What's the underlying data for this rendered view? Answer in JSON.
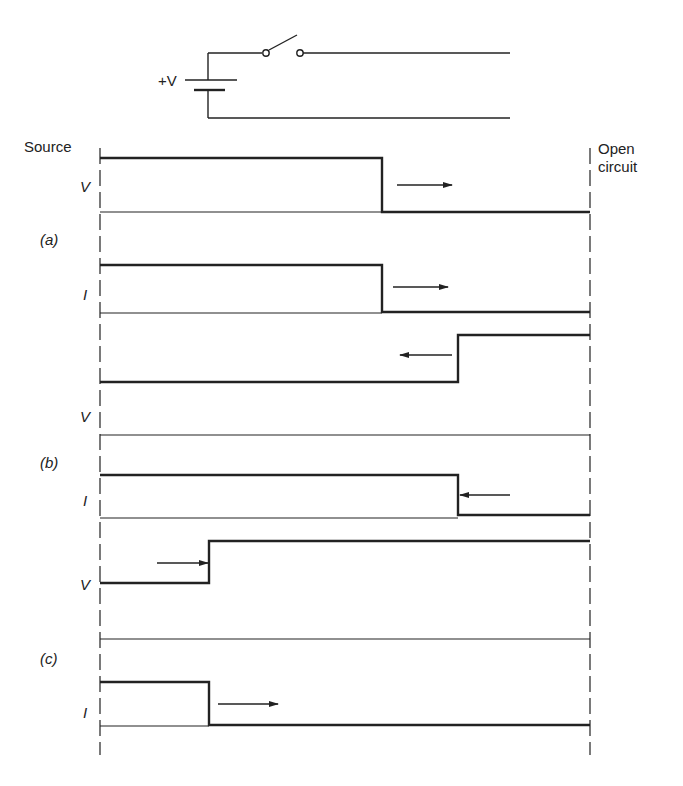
{
  "circuit": {
    "battery_label": "+V",
    "components": [
      "battery",
      "switch (open)",
      "transmission line (two wires)"
    ]
  },
  "labels": {
    "source": "Source",
    "open_circuit_line1": "Open",
    "open_circuit_line2": "circuit",
    "voltage": "V",
    "current": "I",
    "case_a": "(a)",
    "case_b": "(b)",
    "case_c": "(c)"
  },
  "colors": {
    "ink": "#222222",
    "background": "#ffffff"
  },
  "waveforms": [
    {
      "case": "(a)",
      "quantity": "V",
      "description": "Voltage step travelling toward open circuit",
      "step_fraction": 0.577,
      "arrow": "right"
    },
    {
      "case": "(a)",
      "quantity": "I",
      "description": "Current step travelling toward open circuit",
      "step_fraction": 0.577,
      "arrow": "right"
    },
    {
      "case": "(b)",
      "quantity": "V",
      "description": "Reflected voltage doubling travelling back to source",
      "step_fraction": 0.731,
      "arrow": "left"
    },
    {
      "case": "(b)",
      "quantity": "I",
      "description": "Reflected current cancelling travelling back to source",
      "step_fraction": 0.731,
      "arrow": "left"
    },
    {
      "case": "(c)",
      "quantity": "V",
      "description": "Voltage after reflection",
      "step_fraction": 0.222,
      "arrow": "right"
    },
    {
      "case": "(c)",
      "quantity": "I",
      "description": "Current after reflection",
      "step_fraction": 0.222,
      "arrow": "right"
    }
  ]
}
